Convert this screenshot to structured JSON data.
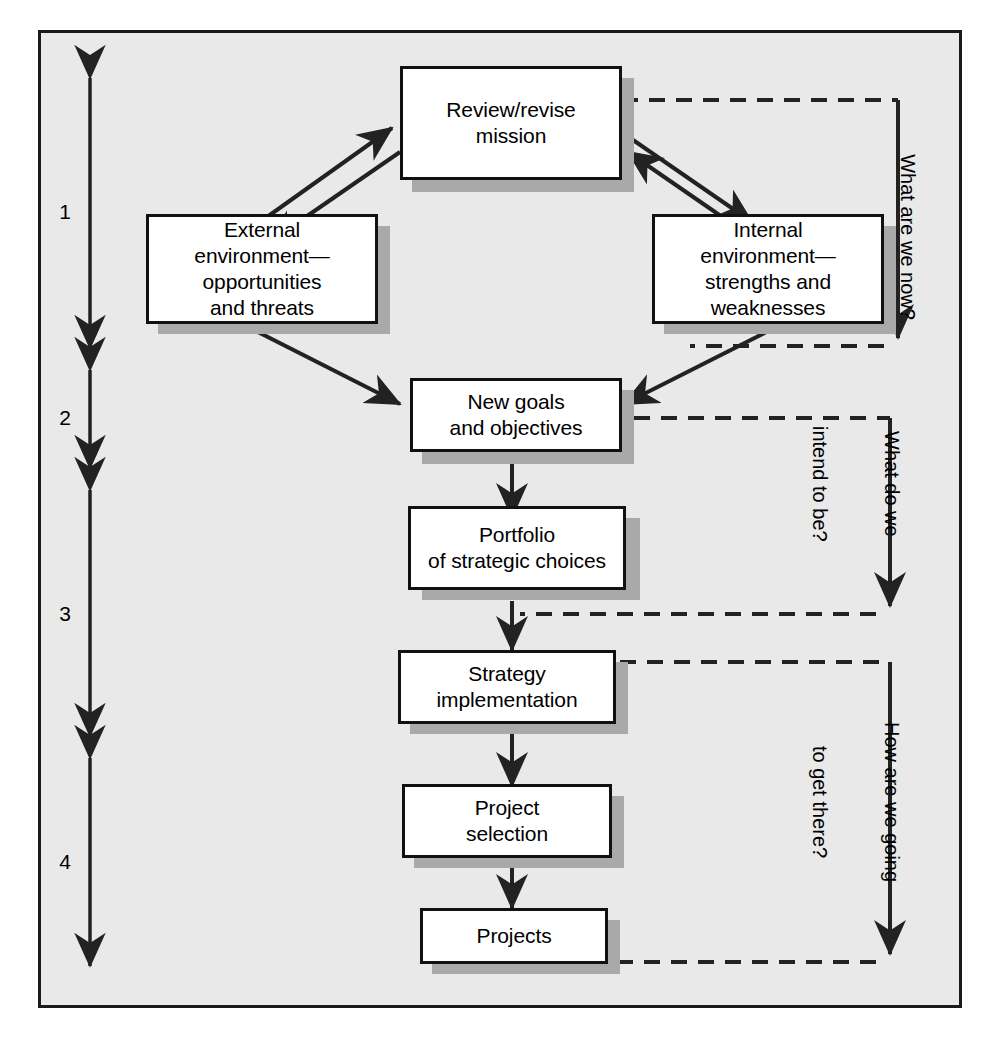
{
  "diagram": {
    "frame": {
      "background": "#e9e9e9",
      "border_color": "#1a1a1a"
    },
    "box_fill": "#ffffff",
    "box_border": "#111111",
    "shadow_color": "#a9a9a9",
    "line_color": "#222222",
    "nodes": [
      {
        "id": "mission",
        "label": "Review/revise\nmission"
      },
      {
        "id": "external",
        "label": "External\nenvironment—\nopportunities\nand threats"
      },
      {
        "id": "internal",
        "label": "Internal\nenvironment—\nstrengths and\nweaknesses"
      },
      {
        "id": "goals",
        "label": "New goals\nand objectives"
      },
      {
        "id": "portfolio",
        "label": "Portfolio\nof strategic choices"
      },
      {
        "id": "strategy",
        "label": "Strategy\nimplementation"
      },
      {
        "id": "selection",
        "label": "Project\nselection"
      },
      {
        "id": "projects",
        "label": "Projects"
      }
    ],
    "stages": [
      {
        "number": "1"
      },
      {
        "number": "2"
      },
      {
        "number": "3"
      },
      {
        "number": "4"
      }
    ],
    "feedback_labels": [
      {
        "id": "loop1",
        "line1": "What are we now?",
        "line2": ""
      },
      {
        "id": "loop2",
        "line1": "What do we",
        "line2": "intend to be?"
      },
      {
        "id": "loop3",
        "line1": "How are we going",
        "line2": "to get there?"
      }
    ]
  }
}
